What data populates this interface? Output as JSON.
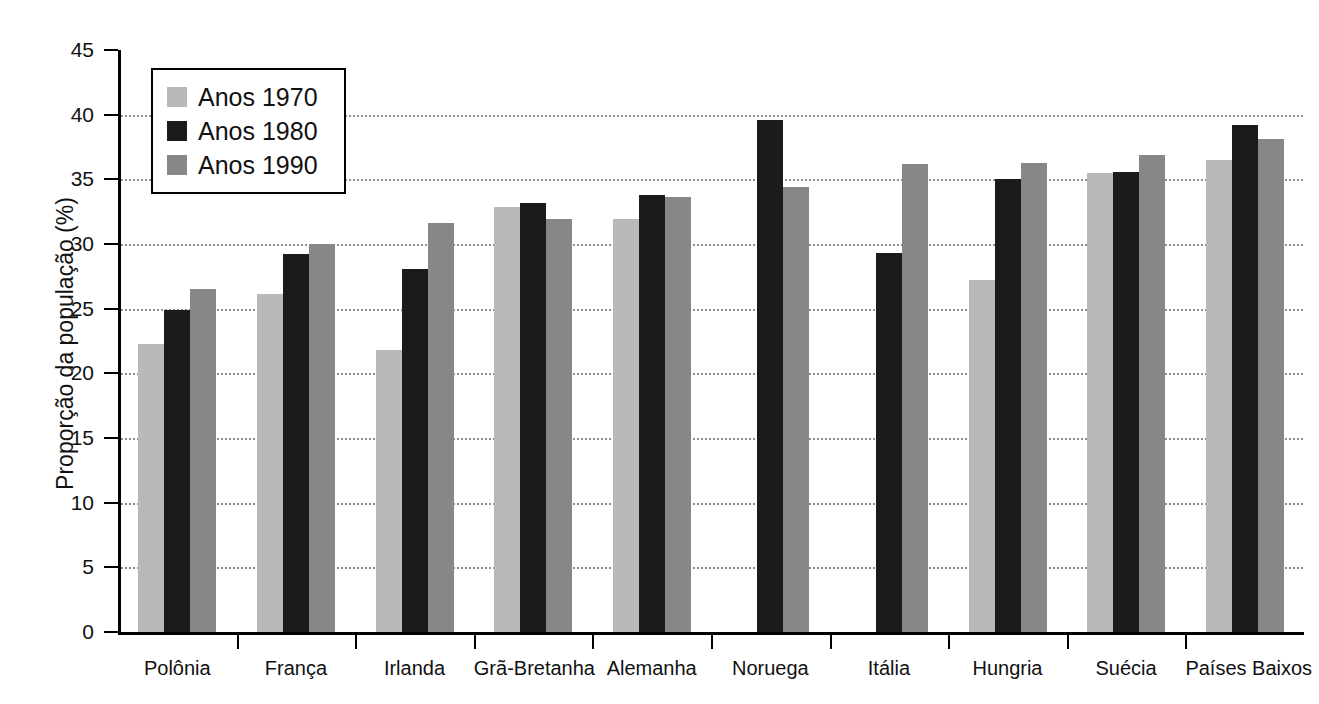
{
  "chart_data": {
    "type": "bar",
    "title": "",
    "subtitle": "",
    "xlabel": "",
    "ylabel": "Proporção da população (%)",
    "ylim": [
      0,
      45
    ],
    "yticks": [
      0,
      5,
      10,
      15,
      20,
      25,
      30,
      35,
      40,
      45
    ],
    "ytick_labels": [
      "0",
      "5",
      "10",
      "15",
      "20",
      "25",
      "30",
      "35",
      "40",
      "45"
    ],
    "grid": "horizontal-dotted",
    "legend_position": "top-left-inside",
    "categories": [
      "Polônia",
      "França",
      "Irlanda",
      "Grã-Bretanha",
      "Alemanha",
      "Noruega",
      "Itália",
      "Hungria",
      "Suécia",
      "Países Baixos"
    ],
    "series": [
      {
        "name": "Anos 1970",
        "color": "#b9b9b9",
        "values": [
          22.3,
          26.1,
          21.8,
          32.9,
          31.9,
          null,
          null,
          27.2,
          35.5,
          36.5
        ]
      },
      {
        "name": "Anos 1980",
        "color": "#1b1b1b",
        "values": [
          24.9,
          29.2,
          28.1,
          33.2,
          33.8,
          39.6,
          29.3,
          35.0,
          35.6,
          39.2
        ]
      },
      {
        "name": "Anos 1990",
        "color": "#878787",
        "values": [
          26.5,
          30.0,
          31.6,
          31.9,
          33.6,
          34.4,
          36.2,
          36.3,
          36.9,
          38.1
        ]
      }
    ]
  },
  "legend": {
    "items": [
      {
        "label": "Anos 1970",
        "color": "#b9b9b9"
      },
      {
        "label": "Anos 1980",
        "color": "#1b1b1b"
      },
      {
        "label": "Anos 1990",
        "color": "#878787"
      }
    ]
  }
}
